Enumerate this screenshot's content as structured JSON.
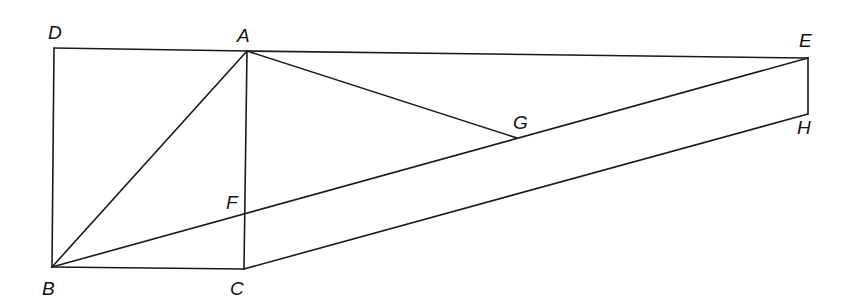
{
  "diagram": {
    "type": "geometric-figure",
    "points": {
      "D": {
        "label": "D",
        "x": 54,
        "y": 48,
        "lx": 48,
        "ly": 39
      },
      "A": {
        "label": "A",
        "x": 247,
        "y": 51,
        "lx": 237,
        "ly": 42
      },
      "E": {
        "label": "E",
        "x": 808,
        "y": 58,
        "lx": 799,
        "ly": 47
      },
      "H": {
        "label": "H",
        "x": 808,
        "y": 114,
        "lx": 797,
        "ly": 134
      },
      "G": {
        "label": "G",
        "x": 517,
        "y": 138,
        "lx": 513,
        "ly": 129
      },
      "F": {
        "label": "F",
        "x": 245,
        "y": 213,
        "lx": 226,
        "ly": 209
      },
      "B": {
        "label": "B",
        "x": 52,
        "y": 267,
        "lx": 42,
        "ly": 295
      },
      "C": {
        "label": "C",
        "x": 244,
        "y": 269,
        "lx": 230,
        "ly": 295
      }
    },
    "segments": [
      [
        "D",
        "A"
      ],
      [
        "A",
        "E"
      ],
      [
        "D",
        "B"
      ],
      [
        "B",
        "C"
      ],
      [
        "A",
        "C"
      ],
      [
        "A",
        "B"
      ],
      [
        "B",
        "E"
      ],
      [
        "A",
        "G"
      ],
      [
        "C",
        "H"
      ],
      [
        "E",
        "H"
      ]
    ],
    "colors": {
      "stroke": "#1a1a1a",
      "label": "#111111",
      "background": "#ffffff"
    }
  }
}
